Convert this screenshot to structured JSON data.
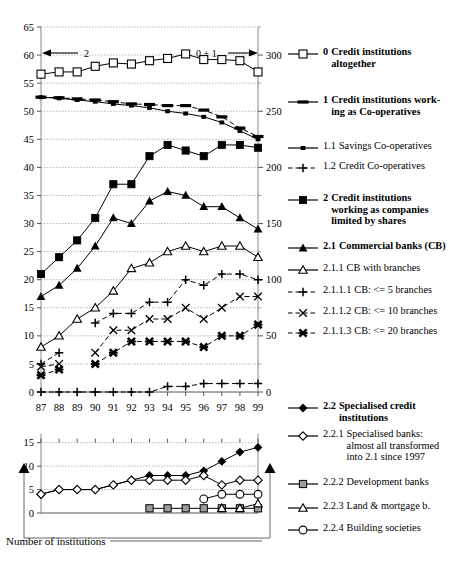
{
  "caption": "Number of institutions",
  "annotations": {
    "left_arrow_label": "2",
    "right_arrow_label": "0 + 1"
  },
  "chart_data": [
    {
      "type": "line",
      "title": "Number of institutions (main panel)",
      "xlabel": "",
      "ylabel": "",
      "grid": true,
      "legend": "right",
      "x": [
        "87",
        "88",
        "89",
        "90",
        "91",
        "92",
        "93",
        "94",
        "95",
        "96",
        "97",
        "98",
        "99"
      ],
      "yleft_ticks": [
        0,
        5,
        10,
        15,
        20,
        25,
        30,
        35,
        40,
        45,
        50,
        55,
        60,
        65
      ],
      "ylim_left": [
        0,
        65
      ],
      "yright_ticks": [
        0,
        50,
        100,
        150,
        200,
        250,
        300
      ],
      "ylim_right": [
        0,
        325
      ],
      "series": [
        {
          "key": "0",
          "name": "Credit institutions altogether",
          "axis": "right",
          "marker": "open-square",
          "line": "solid",
          "values": [
            283,
            285,
            285,
            290,
            293,
            292,
            295,
            297,
            301,
            296,
            296,
            295,
            285
          ]
        },
        {
          "key": "1",
          "name": "Credit institutions working as Co-operatives",
          "axis": "left",
          "marker": "thick-dash",
          "line": "dashed",
          "values": [
            52.5,
            52.4,
            52.2,
            52,
            51.7,
            51.3,
            51.2,
            51,
            51,
            50.2,
            49,
            47,
            45.5
          ]
        },
        {
          "key": "1.1",
          "name": "Savings Co-operatives",
          "axis": "left",
          "marker": "small-square-filled",
          "line": "solid",
          "values": [
            52.5,
            52.3,
            52,
            51.7,
            51.3,
            51,
            50.6,
            50,
            49.6,
            49,
            48,
            46.5,
            45
          ]
        },
        {
          "key": "1.2",
          "name": "Credit Co-operatives",
          "axis": "left",
          "marker": "plus",
          "line": "dashed",
          "values": [
            0,
            0,
            0,
            0,
            0,
            0,
            0,
            1,
            1,
            1.5,
            1.5,
            1.5,
            1.5
          ]
        },
        {
          "key": "2",
          "name": "Credit institutions working as companies limited by shares",
          "axis": "left",
          "marker": "square-filled",
          "line": "solid",
          "values": [
            21,
            24,
            27,
            31,
            37,
            37,
            42,
            44,
            43,
            42,
            44,
            44,
            43.5
          ]
        },
        {
          "key": "2.1",
          "name": "Commercial banks (CB)",
          "axis": "left",
          "marker": "triangle-filled",
          "line": "solid",
          "values": [
            17,
            19,
            22,
            26,
            31,
            30,
            34,
            35.7,
            35,
            33,
            33,
            31,
            29
          ]
        },
        {
          "key": "2.1.1",
          "name": "CB with branches",
          "axis": "left",
          "marker": "triangle-open",
          "line": "solid",
          "values": [
            8,
            10,
            13,
            15,
            18,
            22,
            23,
            25,
            26,
            25,
            26,
            26,
            24
          ]
        },
        {
          "key": "2.1.1.1",
          "name": "CB: <=  5 branches",
          "axis": "left",
          "marker": "plus",
          "line": "dashed",
          "values": [
            5,
            7,
            null,
            12.3,
            14,
            14,
            16,
            16,
            20,
            19,
            21,
            21,
            20
          ]
        },
        {
          "key": "2.1.1.2",
          "name": "CB: <= 10 branches",
          "axis": "left",
          "marker": "x-thin",
          "line": "dashed",
          "values": [
            4.5,
            5,
            null,
            7,
            11,
            11,
            13,
            13,
            15,
            13,
            15,
            17,
            17
          ]
        },
        {
          "key": "2.1.1.3",
          "name": "CB: <= 20 branches",
          "axis": "left",
          "marker": "x-bold",
          "line": "dashed",
          "values": [
            3,
            4,
            null,
            5,
            7,
            9,
            9,
            9,
            9,
            8,
            10,
            10,
            12
          ]
        }
      ]
    },
    {
      "type": "line",
      "title": "Number of institutions (lower panel)",
      "xlabel": "",
      "ylabel": "",
      "grid": true,
      "legend": "right",
      "x": [
        "87",
        "88",
        "89",
        "90",
        "91",
        "92",
        "93",
        "94",
        "95",
        "96",
        "97",
        "98",
        "99"
      ],
      "yleft_ticks": [
        0,
        5,
        10,
        15
      ],
      "ylim_left": [
        0,
        16
      ],
      "series": [
        {
          "key": "2.2",
          "name": "Specialised credit institutions",
          "marker": "diamond-filled",
          "line": "solid",
          "values": [
            4,
            5,
            5,
            5,
            6,
            7,
            8,
            8,
            8,
            9,
            11,
            13,
            14
          ]
        },
        {
          "key": "2.2.1",
          "name": "Specialised banks: almost all transformed into 2.1 since 1997",
          "marker": "diamond-open",
          "line": "solid",
          "values": [
            4,
            5,
            5,
            5,
            6,
            7,
            7,
            7,
            7,
            8,
            6,
            7,
            7
          ]
        },
        {
          "key": "2.2.2",
          "name": "Development banks",
          "marker": "gray-square",
          "line": "solid",
          "values": [
            null,
            null,
            null,
            null,
            null,
            null,
            1,
            1,
            1,
            1,
            1,
            1,
            1
          ]
        },
        {
          "key": "2.2.3",
          "name": "Land & mortgage b.",
          "marker": "triangle-open",
          "line": "solid",
          "values": [
            null,
            null,
            null,
            null,
            null,
            null,
            null,
            null,
            null,
            null,
            1,
            1,
            2
          ]
        },
        {
          "key": "2.2.4",
          "name": "Building societies",
          "marker": "circle-open",
          "line": "solid",
          "values": [
            null,
            null,
            null,
            null,
            null,
            null,
            null,
            null,
            null,
            3,
            4,
            4,
            4
          ]
        }
      ]
    }
  ],
  "legend": [
    {
      "id": "0",
      "num": "0",
      "label": "Credit institutions\naltogether",
      "bold": true,
      "marker": "open-square",
      "line": "solid"
    },
    {
      "id": "1",
      "num": "1",
      "label": "Credit institutions work-\ning as Co-operatives",
      "bold": true,
      "marker": "thick-dash",
      "line": "solid"
    },
    {
      "id": "1.1",
      "num": "1.1",
      "label": "Savings Co-operatives",
      "bold": false,
      "marker": "small-square-filled",
      "line": "solid"
    },
    {
      "id": "1.2",
      "num": "1.2",
      "label": "Credit Co-operatives",
      "bold": false,
      "marker": "plus",
      "line": "dashed"
    },
    {
      "id": "2",
      "num": "2",
      "label": "Credit institutions\nworking as companies\nlimited by shares",
      "bold": true,
      "marker": "square-filled",
      "line": "solid"
    },
    {
      "id": "2.1",
      "num": "2.1",
      "label": "Commercial banks (CB)",
      "bold": true,
      "marker": "triangle-filled",
      "line": "solid"
    },
    {
      "id": "2.1.1",
      "num": "2.1.1",
      "label": "CB with branches",
      "bold": false,
      "marker": "triangle-open",
      "line": "solid"
    },
    {
      "id": "2.1.1.1",
      "num": "2.1.1.1",
      "label": "CB: <=  5 branches",
      "bold": false,
      "marker": "plus",
      "line": "dashed"
    },
    {
      "id": "2.1.1.2",
      "num": "2.1.1.2",
      "label": "CB: <= 10 branches",
      "bold": false,
      "marker": "x-thin",
      "line": "dashed"
    },
    {
      "id": "2.1.1.3",
      "num": "2.1.1.3",
      "label": "CB: <= 20 branches",
      "bold": false,
      "marker": "x-bold",
      "line": "dashed"
    },
    {
      "id": "2.2",
      "num": "2.2",
      "label": "Specialised credit\ninstitutions",
      "bold": true,
      "marker": "diamond-filled",
      "line": "solid"
    },
    {
      "id": "2.2.1",
      "num": "2.2.1",
      "label": "Specialised banks:\nalmost all transformed\ninto 2.1 since 1997",
      "bold": false,
      "marker": "diamond-open",
      "line": "solid"
    },
    {
      "id": "2.2.2",
      "num": "2.2.2",
      "label": "Development banks",
      "bold": false,
      "marker": "gray-square",
      "line": "solid"
    },
    {
      "id": "2.2.3",
      "num": "2.2.3",
      "label": "Land & mortgage b.",
      "bold": false,
      "marker": "triangle-open",
      "line": "solid"
    },
    {
      "id": "2.2.4",
      "num": "2.2.4",
      "label": "Building societies",
      "bold": false,
      "marker": "circle-open",
      "line": "solid"
    }
  ],
  "colors": {
    "ink": "#000000",
    "grid": "#9a9a9a",
    "gray_fill": "#9c9c9c"
  }
}
